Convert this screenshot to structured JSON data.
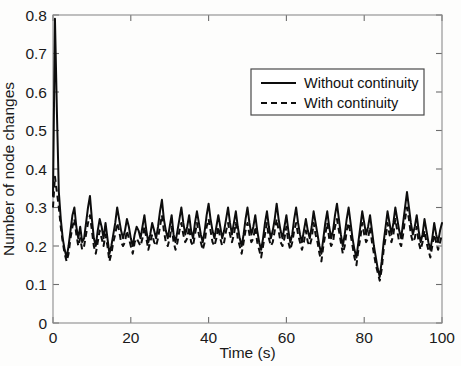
{
  "chart_data": {
    "type": "line",
    "title": "",
    "xlabel": "Time (s)",
    "ylabel": "Number of node changes",
    "xlim": [
      0,
      100
    ],
    "ylim": [
      0,
      0.8
    ],
    "xticks": [
      0,
      20,
      40,
      60,
      80,
      100
    ],
    "xtick_labels": [
      "0",
      "20",
      "40",
      "60",
      "80",
      "100"
    ],
    "yticks": [
      0,
      0.1,
      0.2,
      0.3,
      0.4,
      0.5,
      0.6,
      0.7,
      0.8
    ],
    "ytick_labels": [
      "0",
      "0.1",
      "0.2",
      "0.3",
      "0.4",
      "0.5",
      "0.6",
      "0.7",
      "0.8"
    ],
    "grid": false,
    "legend_position": "upper right",
    "legend_entries": [
      {
        "name": "Without continuity",
        "style": "solid"
      },
      {
        "name": "With continuity",
        "style": "dashed"
      }
    ],
    "x": [
      0,
      0.5,
      1,
      1.5,
      2,
      2.5,
      3,
      3.5,
      4,
      4.5,
      5,
      5.5,
      6,
      6.5,
      7,
      7.5,
      8,
      8.5,
      9,
      9.5,
      10,
      10.5,
      11,
      11.5,
      12,
      12.5,
      13,
      13.5,
      14,
      14.5,
      15,
      15.5,
      16,
      16.5,
      17,
      17.5,
      18,
      18.5,
      19,
      19.5,
      20,
      20.5,
      21,
      21.5,
      22,
      22.5,
      23,
      23.5,
      24,
      24.5,
      25,
      25.5,
      26,
      26.5,
      27,
      27.5,
      28,
      28.5,
      29,
      29.5,
      30,
      30.5,
      31,
      31.5,
      32,
      32.5,
      33,
      33.5,
      34,
      34.5,
      35,
      35.5,
      36,
      36.5,
      37,
      37.5,
      38,
      38.5,
      39,
      39.5,
      40,
      40.5,
      41,
      41.5,
      42,
      42.5,
      43,
      43.5,
      44,
      44.5,
      45,
      45.5,
      46,
      46.5,
      47,
      47.5,
      48,
      48.5,
      49,
      49.5,
      50,
      50.5,
      51,
      51.5,
      52,
      52.5,
      53,
      53.5,
      54,
      54.5,
      55,
      55.5,
      56,
      56.5,
      57,
      57.5,
      58,
      58.5,
      59,
      59.5,
      60,
      60.5,
      61,
      61.5,
      62,
      62.5,
      63,
      63.5,
      64,
      64.5,
      65,
      65.5,
      66,
      66.5,
      67,
      67.5,
      68,
      68.5,
      69,
      69.5,
      70,
      70.5,
      71,
      71.5,
      72,
      72.5,
      73,
      73.5,
      74,
      74.5,
      75,
      75.5,
      76,
      76.5,
      77,
      77.5,
      78,
      78.5,
      79,
      79.5,
      80,
      80.5,
      81,
      81.5,
      82,
      82.5,
      83,
      83.5,
      84,
      84.5,
      85,
      85.5,
      86,
      86.5,
      87,
      87.5,
      88,
      88.5,
      89,
      89.5,
      90,
      90.5,
      91,
      91.5,
      92,
      92.5,
      93,
      93.5,
      94,
      94.5,
      95,
      95.5,
      96,
      96.5,
      97,
      97.5,
      98,
      98.5,
      99,
      99.5,
      100
    ],
    "series": [
      {
        "name": "Without continuity",
        "style": "solid",
        "values": [
          0.33,
          0.79,
          0.55,
          0.34,
          0.27,
          0.22,
          0.19,
          0.17,
          0.2,
          0.24,
          0.28,
          0.3,
          0.25,
          0.22,
          0.25,
          0.21,
          0.22,
          0.26,
          0.3,
          0.33,
          0.27,
          0.22,
          0.2,
          0.24,
          0.27,
          0.25,
          0.22,
          0.26,
          0.22,
          0.18,
          0.2,
          0.23,
          0.26,
          0.3,
          0.27,
          0.24,
          0.22,
          0.24,
          0.27,
          0.25,
          0.22,
          0.2,
          0.23,
          0.25,
          0.24,
          0.22,
          0.25,
          0.28,
          0.24,
          0.21,
          0.23,
          0.26,
          0.24,
          0.22,
          0.25,
          0.29,
          0.32,
          0.27,
          0.24,
          0.22,
          0.25,
          0.28,
          0.23,
          0.21,
          0.24,
          0.27,
          0.3,
          0.26,
          0.23,
          0.25,
          0.28,
          0.24,
          0.22,
          0.26,
          0.29,
          0.26,
          0.23,
          0.21,
          0.24,
          0.28,
          0.31,
          0.27,
          0.24,
          0.22,
          0.25,
          0.28,
          0.25,
          0.22,
          0.24,
          0.27,
          0.3,
          0.26,
          0.23,
          0.26,
          0.29,
          0.25,
          0.22,
          0.2,
          0.23,
          0.27,
          0.3,
          0.26,
          0.23,
          0.25,
          0.28,
          0.24,
          0.21,
          0.19,
          0.22,
          0.26,
          0.29,
          0.25,
          0.22,
          0.24,
          0.27,
          0.31,
          0.27,
          0.24,
          0.22,
          0.25,
          0.28,
          0.24,
          0.21,
          0.23,
          0.27,
          0.3,
          0.26,
          0.23,
          0.21,
          0.24,
          0.27,
          0.24,
          0.22,
          0.25,
          0.29,
          0.26,
          0.23,
          0.2,
          0.18,
          0.22,
          0.26,
          0.29,
          0.25,
          0.22,
          0.24,
          0.28,
          0.31,
          0.27,
          0.23,
          0.2,
          0.23,
          0.27,
          0.3,
          0.26,
          0.22,
          0.19,
          0.17,
          0.21,
          0.25,
          0.29,
          0.26,
          0.23,
          0.25,
          0.28,
          0.24,
          0.2,
          0.17,
          0.14,
          0.12,
          0.16,
          0.21,
          0.25,
          0.29,
          0.26,
          0.23,
          0.26,
          0.3,
          0.27,
          0.24,
          0.22,
          0.26,
          0.3,
          0.34,
          0.3,
          0.26,
          0.23,
          0.25,
          0.28,
          0.24,
          0.21,
          0.23,
          0.27,
          0.24,
          0.21,
          0.19,
          0.22,
          0.26,
          0.23,
          0.21,
          0.24,
          0.26
        ]
      },
      {
        "name": "With continuity",
        "style": "dashed",
        "values": [
          0.3,
          0.38,
          0.34,
          0.3,
          0.25,
          0.21,
          0.18,
          0.16,
          0.18,
          0.22,
          0.25,
          0.27,
          0.23,
          0.2,
          0.22,
          0.19,
          0.2,
          0.23,
          0.26,
          0.28,
          0.24,
          0.2,
          0.18,
          0.21,
          0.24,
          0.22,
          0.2,
          0.23,
          0.2,
          0.16,
          0.18,
          0.21,
          0.23,
          0.26,
          0.24,
          0.21,
          0.2,
          0.21,
          0.24,
          0.22,
          0.2,
          0.18,
          0.21,
          0.22,
          0.21,
          0.2,
          0.22,
          0.25,
          0.22,
          0.19,
          0.21,
          0.23,
          0.21,
          0.2,
          0.22,
          0.25,
          0.28,
          0.24,
          0.21,
          0.2,
          0.22,
          0.25,
          0.21,
          0.19,
          0.21,
          0.24,
          0.26,
          0.23,
          0.21,
          0.22,
          0.25,
          0.21,
          0.2,
          0.23,
          0.26,
          0.23,
          0.21,
          0.19,
          0.21,
          0.25,
          0.27,
          0.24,
          0.21,
          0.2,
          0.22,
          0.25,
          0.22,
          0.2,
          0.21,
          0.24,
          0.26,
          0.23,
          0.21,
          0.23,
          0.26,
          0.22,
          0.2,
          0.18,
          0.21,
          0.24,
          0.26,
          0.23,
          0.21,
          0.22,
          0.25,
          0.21,
          0.19,
          0.17,
          0.2,
          0.23,
          0.26,
          0.22,
          0.2,
          0.21,
          0.24,
          0.27,
          0.24,
          0.21,
          0.2,
          0.22,
          0.25,
          0.21,
          0.19,
          0.21,
          0.24,
          0.26,
          0.23,
          0.21,
          0.19,
          0.21,
          0.24,
          0.21,
          0.2,
          0.22,
          0.26,
          0.23,
          0.21,
          0.18,
          0.16,
          0.2,
          0.23,
          0.26,
          0.22,
          0.2,
          0.21,
          0.25,
          0.27,
          0.24,
          0.21,
          0.18,
          0.2,
          0.24,
          0.26,
          0.23,
          0.2,
          0.17,
          0.15,
          0.19,
          0.22,
          0.26,
          0.23,
          0.21,
          0.22,
          0.25,
          0.21,
          0.18,
          0.15,
          0.13,
          0.11,
          0.14,
          0.19,
          0.22,
          0.26,
          0.23,
          0.21,
          0.23,
          0.27,
          0.24,
          0.21,
          0.2,
          0.23,
          0.27,
          0.3,
          0.27,
          0.23,
          0.21,
          0.22,
          0.25,
          0.21,
          0.19,
          0.21,
          0.24,
          0.21,
          0.19,
          0.17,
          0.2,
          0.23,
          0.21,
          0.19,
          0.21,
          0.23
        ]
      }
    ]
  }
}
